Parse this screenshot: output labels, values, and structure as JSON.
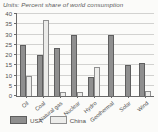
{
  "chart_data": {
    "type": "bar",
    "title": "Units: Percent share of world consumption",
    "categories": [
      "Oil",
      "Coal",
      "Natural gas",
      "Nuclear",
      "Hydro",
      "Geothermal",
      "Solar",
      "Wind"
    ],
    "series": [
      {
        "name": "USA",
        "color": "#8f8f8f",
        "border": "#5e5e5e",
        "values": [
          25,
          20,
          23.5,
          30,
          9.5,
          30,
          15,
          16
        ]
      },
      {
        "name": "China",
        "color": "#ececea",
        "border": "#8f8f8f",
        "values": [
          10,
          37,
          2,
          2,
          14,
          0,
          0,
          2.5
        ]
      }
    ],
    "ylim": [
      0,
      40
    ],
    "yticks": [
      0,
      5,
      10,
      15,
      20,
      25,
      30,
      35,
      40
    ],
    "grid": true,
    "legend_position": "bottom",
    "xlabel": "",
    "ylabel": ""
  },
  "colors": {
    "background": "#fbfbf9",
    "gridline": "#d2d2d0",
    "axis": "#6a6a6a",
    "text": "#4f4f4f"
  }
}
